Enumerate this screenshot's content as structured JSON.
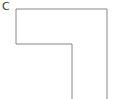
{
  "diagram": {
    "label": "C",
    "shape": "inverted-L outline",
    "stroke_color": "#888888",
    "points": [
      [
        16,
        9
      ],
      [
        107,
        9
      ],
      [
        107,
        99
      ],
      [
        72,
        99
      ],
      [
        72,
        44
      ],
      [
        16,
        44
      ]
    ]
  }
}
